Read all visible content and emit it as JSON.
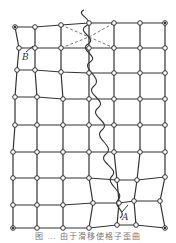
{
  "figure": {
    "caption": "图 … 由于滑移使格子歪曲",
    "labels": {
      "B": "B",
      "A": "A"
    },
    "colors": {
      "line": "#333333",
      "node_fill": "#ffffff",
      "dashed": "#555555"
    },
    "grid": {
      "columns": 7,
      "rows": 9
    }
  }
}
